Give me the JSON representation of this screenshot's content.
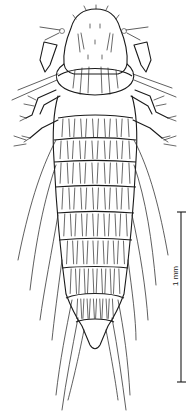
{
  "figure": {
    "body_regions": [
      "head",
      "prothorax",
      "mesothorax",
      "metathorax",
      "abdominal segments 1-10"
    ],
    "colors": {
      "line": "#1a1a1a",
      "background": "#ffffff"
    }
  },
  "scale_bar": {
    "label": "1 mm",
    "top_y": 212,
    "bottom_y": 382,
    "x": 181
  }
}
